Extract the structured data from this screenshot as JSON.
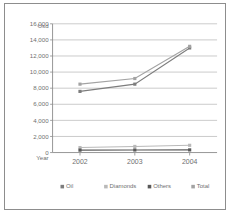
{
  "chart_data": {
    "type": "line",
    "title": "",
    "xlabel": "Year",
    "ylabel": "Usd",
    "categories": [
      "2002",
      "2003",
      "2004"
    ],
    "x": [
      2002,
      2003,
      2004
    ],
    "ylim": [
      0,
      16000
    ],
    "yticks": [
      0,
      2000,
      4000,
      6000,
      8000,
      10000,
      12000,
      14000,
      16000
    ],
    "ytick_labels": [
      "0",
      "2,000",
      "4,000",
      "6,000",
      "8,000",
      "10,000",
      "12,000",
      "14,000",
      "16,000"
    ],
    "grid": true,
    "legend_position": "bottom",
    "series": [
      {
        "name": "Oil",
        "values": [
          7600,
          8500,
          13000
        ],
        "color": "#7d7d7d",
        "marker": "square"
      },
      {
        "name": "Diamonds",
        "values": [
          620,
          760,
          900
        ],
        "color": "#b9b9b9",
        "marker": "square"
      },
      {
        "name": "Others",
        "values": [
          300,
          320,
          330
        ],
        "color": "#595959",
        "marker": "square"
      },
      {
        "name": "Total",
        "values": [
          8500,
          9200,
          13200
        ],
        "color": "#a3a3a3",
        "marker": "square"
      }
    ]
  },
  "axes": {
    "y_title": "Usd",
    "x_title": "Year"
  },
  "legend": {
    "items": [
      {
        "label": "Oil",
        "color": "#7d7d7d"
      },
      {
        "label": "Diamonds",
        "color": "#b9b9b9"
      },
      {
        "label": "Others",
        "color": "#595959"
      },
      {
        "label": "Total",
        "color": "#a3a3a3"
      }
    ]
  },
  "colors": {
    "frame_border": "#8d8d8d",
    "gridline": "#b4b4b4",
    "axis": "#8a8a8a",
    "text": "#6f6f6f",
    "background": "#ffffff"
  }
}
